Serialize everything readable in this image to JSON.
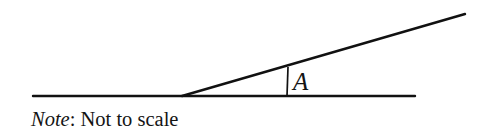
{
  "figure": {
    "background_color": "#ffffff",
    "stroke_color": "#111111",
    "width": 487,
    "height": 138,
    "angle_label": "A",
    "caption": {
      "emphasis": "Note",
      "rest": ": Not to scale",
      "full_text": "Note: Not to scale"
    }
  },
  "geometry": {
    "vertex": {
      "x": 182,
      "y": 96
    },
    "horizontal_ray": {
      "x1": 33,
      "y1": 96,
      "x2": 415,
      "y2": 96
    },
    "slanted_ray": {
      "x1": 182,
      "y1": 96,
      "x2": 465,
      "y2": 14
    },
    "angle_marker": {
      "x1": 288,
      "y1": 67,
      "x2": 287,
      "y2": 96
    },
    "angle_label_position": {
      "x": 293,
      "y": 90
    }
  }
}
